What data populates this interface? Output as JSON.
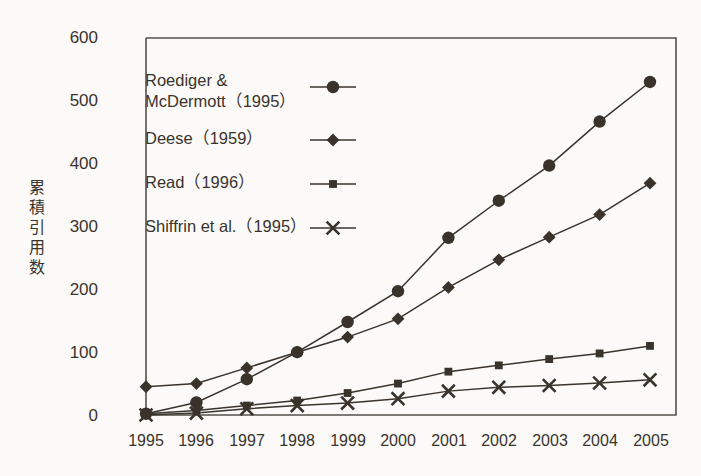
{
  "chart_data": {
    "type": "line",
    "title": "",
    "xlabel": "",
    "ylabel": "累積引用数",
    "x": [
      "1995",
      "1996",
      "1997",
      "1998",
      "1999",
      "2000",
      "2001",
      "2002",
      "2003",
      "2004",
      "2005"
    ],
    "categories": [
      "1995",
      "1996",
      "1997",
      "1998",
      "1999",
      "2000",
      "2001",
      "2002",
      "2003",
      "2004",
      "2005"
    ],
    "ylim": [
      0,
      600
    ],
    "xlim": [
      1995,
      2005
    ],
    "yticks": [
      "0",
      "100",
      "200",
      "300",
      "400",
      "500",
      "600"
    ],
    "ytick_values": [
      0,
      100,
      200,
      300,
      400,
      500,
      600
    ],
    "grid": false,
    "legend_position": "upper-left-inside",
    "series": [
      {
        "name": "Roediger & McDermott（1995）",
        "marker": "circle",
        "values": [
          2,
          20,
          57,
          100,
          148,
          197,
          282,
          341,
          397,
          467,
          530
        ]
      },
      {
        "name": "Deese（1959）",
        "marker": "diamond",
        "values": [
          45,
          50,
          75,
          100,
          124,
          153,
          203,
          247,
          283,
          319,
          369
        ]
      },
      {
        "name": "Read（1996）",
        "marker": "square",
        "values": [
          2,
          7,
          15,
          23,
          35,
          50,
          69,
          79,
          89,
          98,
          110
        ]
      },
      {
        "name": "Shiffrin et al.（1995）",
        "marker": "x",
        "values": [
          0,
          3,
          10,
          15,
          19,
          26,
          38,
          44,
          47,
          51,
          56
        ]
      }
    ]
  },
  "axis": {
    "y_label_vertical": "累\n積\n引\n用\n数",
    "y_ticks": [
      "600",
      "500",
      "400",
      "300",
      "200",
      "100",
      "0"
    ],
    "x_ticks": [
      "1995",
      "1996",
      "1997",
      "1998",
      "1999",
      "2000",
      "2001",
      "2002",
      "2003",
      "2004",
      "2005"
    ]
  },
  "legend": {
    "entries": [
      {
        "label": "Roediger &\nMcDermott（1995）",
        "marker": "circle"
      },
      {
        "label": "Deese（1959）",
        "marker": "diamond"
      },
      {
        "label": "Read（1996）",
        "marker": "square"
      },
      {
        "label": "Shiffrin et al.（1995）",
        "marker": "x"
      }
    ]
  },
  "colors": {
    "ink": "#3a332c",
    "background": "#fbfaf8",
    "axis": "#55504a"
  }
}
